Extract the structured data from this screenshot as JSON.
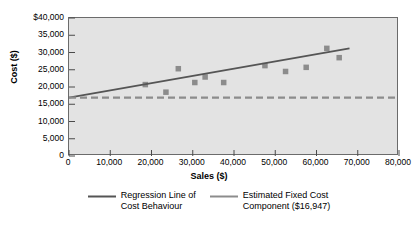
{
  "chart_data": {
    "type": "scatter",
    "title": "",
    "xlabel": "Sales ($)",
    "ylabel": "Cost ($)",
    "xlim": [
      0,
      80000
    ],
    "ylim": [
      0,
      40000
    ],
    "grid": false,
    "legend_position": "bottom",
    "xticks": [
      {
        "value": 0,
        "label": "0"
      },
      {
        "value": 10000,
        "label": "10,000"
      },
      {
        "value": 20000,
        "label": "20,000"
      },
      {
        "value": 30000,
        "label": "30,000"
      },
      {
        "value": 40000,
        "label": "40,000"
      },
      {
        "value": 50000,
        "label": "50,000"
      },
      {
        "value": 60000,
        "label": "60,000"
      },
      {
        "value": 70000,
        "label": "70,000"
      },
      {
        "value": 80000,
        "label": "80,000"
      }
    ],
    "yticks": [
      {
        "value": 0,
        "label": "0"
      },
      {
        "value": 5000,
        "label": "5,000"
      },
      {
        "value": 10000,
        "label": "10,000"
      },
      {
        "value": 15000,
        "label": "15,000"
      },
      {
        "value": 20000,
        "label": "20,000"
      },
      {
        "value": 25000,
        "label": "25,000"
      },
      {
        "value": 30000,
        "label": "30,000"
      },
      {
        "value": 35000,
        "label": "35,000"
      },
      {
        "value": 40000,
        "label": "$40,000"
      }
    ],
    "series": [
      {
        "name": "Observed cost data",
        "type": "scatter",
        "marker": "square",
        "color": "#8c8c8c",
        "points": [
          {
            "x": 18500,
            "y": 20700
          },
          {
            "x": 23500,
            "y": 18500
          },
          {
            "x": 26500,
            "y": 25300
          },
          {
            "x": 30500,
            "y": 21300
          },
          {
            "x": 33000,
            "y": 22900
          },
          {
            "x": 37500,
            "y": 21300
          },
          {
            "x": 47500,
            "y": 26200
          },
          {
            "x": 52500,
            "y": 24500
          },
          {
            "x": 57500,
            "y": 25700
          },
          {
            "x": 62500,
            "y": 31200
          },
          {
            "x": 65500,
            "y": 28500
          }
        ]
      },
      {
        "name": "Regression Line of Cost Behaviour",
        "type": "line",
        "style": "solid",
        "color": "#555555",
        "intercept": 16947,
        "points": [
          {
            "x": 0,
            "y": 16947
          },
          {
            "x": 68000,
            "y": 31200
          }
        ]
      },
      {
        "name": "Estimated Fixed Cost Component ($16,947)",
        "type": "line",
        "style": "dashed",
        "color": "#8c8c8c",
        "value": 16947,
        "points": [
          {
            "x": 0,
            "y": 16947
          },
          {
            "x": 80000,
            "y": 16947
          }
        ]
      }
    ],
    "legend": [
      {
        "label": "Regression Line of\nCost Behaviour",
        "color": "#555555",
        "style": "solid"
      },
      {
        "label": "Estimated Fixed Cost\nComponent ($16,947)",
        "color": "#8c8c8c",
        "style": "solid"
      }
    ]
  },
  "colors": {
    "plot_background": "#e3e3e3",
    "frame": "#6b6b6b",
    "marker": "#8c8c8c",
    "regression_line": "#555555",
    "fixed_cost_line": "#8c8c8c",
    "page_background": "#ffffff"
  }
}
